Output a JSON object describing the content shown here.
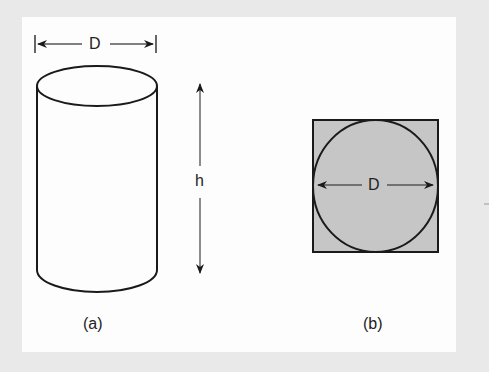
{
  "figure": {
    "part_a": {
      "caption": "(a)",
      "diameter_label": "D",
      "height_label": "h",
      "shape": "cylinder"
    },
    "part_b": {
      "caption": "(b)",
      "diameter_label": "D",
      "shape": "circle-inscribed-in-square"
    },
    "colors": {
      "background": "#e9e9e9",
      "panel": "#fdfdfd",
      "stroke": "#1a1a1a",
      "fill": "#c6c6c6"
    }
  }
}
